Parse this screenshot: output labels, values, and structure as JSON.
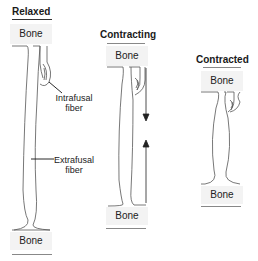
{
  "panels": {
    "relaxed": {
      "title": "Relaxed",
      "top_bone": "Bone",
      "bottom_bone": "Bone"
    },
    "contracting": {
      "title": "Contracting",
      "top_bone": "Bone",
      "bottom_bone": "Bone"
    },
    "contracted": {
      "title": "Contracted",
      "top_bone": "Bone",
      "bottom_bone": "Bone"
    }
  },
  "labels": {
    "intrafusal_line1": "Intrafusal",
    "intrafusal_line2": "fiber",
    "extrafusal_line1": "Extrafusal",
    "extrafusal_line2": "fiber"
  },
  "colors": {
    "line": "#555555",
    "bone_fill": "#f3f3f3",
    "text": "#222222"
  }
}
